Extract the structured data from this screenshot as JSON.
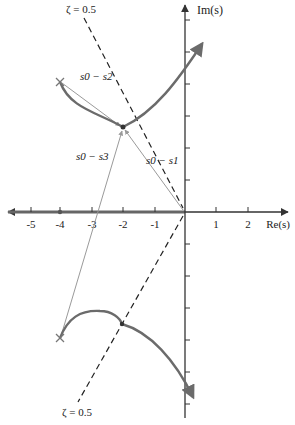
{
  "diagram": {
    "type": "root-locus",
    "axes": {
      "x_label": "Re(s)",
      "y_label": "Im(s)",
      "x_ticks": [
        "-5",
        "-4",
        "-3",
        "-2",
        "-1",
        "1",
        "2"
      ]
    },
    "damping_lines": {
      "top_label": "ζ = 0.5",
      "bottom_label": "ζ = 0.5"
    },
    "vectors": {
      "v1": "s0 − s1",
      "v2": "s0 − s2",
      "v3": "s0 − s3"
    },
    "poles": [
      {
        "name": "s1",
        "re": 0,
        "im": 0
      },
      {
        "name": "s2",
        "re": -4,
        "im": 4
      },
      {
        "name": "s3",
        "re": -4,
        "im": -4
      },
      {
        "name": "p4",
        "re": -4,
        "im": 0
      }
    ],
    "test_point": {
      "name": "s0",
      "re": -2,
      "im": 2.7
    },
    "colors": {
      "locus": "#6b6b6b",
      "axes": "#333333",
      "vectors": "#9a9a9a",
      "dashed": "#222222"
    }
  }
}
